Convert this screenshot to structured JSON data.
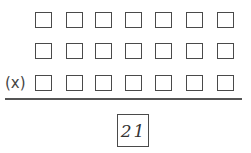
{
  "diagram": {
    "type": "multiplication-digit-boxes",
    "rows": 3,
    "columns": 7,
    "row_tops_px": [
      12,
      43,
      75
    ],
    "column_lefts_px": [
      35,
      66,
      95,
      125,
      155,
      186,
      217
    ],
    "operator_row": 2,
    "operator_label": "(x)",
    "answer": {
      "value": "21"
    }
  }
}
